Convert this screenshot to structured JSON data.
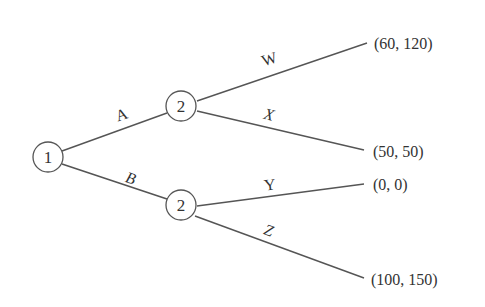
{
  "diagram": {
    "type": "game-tree",
    "nodes": [
      {
        "id": "root",
        "label": "1"
      },
      {
        "id": "p2-top",
        "label": "2"
      },
      {
        "id": "p2-bottom",
        "label": "2"
      }
    ],
    "edges": [
      {
        "from": "root",
        "to": "p2-top",
        "label": "A"
      },
      {
        "from": "root",
        "to": "p2-bottom",
        "label": "B"
      },
      {
        "from": "p2-top",
        "to": "leaf-w",
        "label": "W"
      },
      {
        "from": "p2-top",
        "to": "leaf-x",
        "label": "X"
      },
      {
        "from": "p2-bottom",
        "to": "leaf-y",
        "label": "Y"
      },
      {
        "from": "p2-bottom",
        "to": "leaf-z",
        "label": "Z"
      }
    ],
    "payoffs": [
      {
        "leaf": "leaf-w",
        "label": "(60, 120)"
      },
      {
        "leaf": "leaf-x",
        "label": "(50, 50)"
      },
      {
        "leaf": "leaf-y",
        "label": "(0, 0)"
      },
      {
        "leaf": "leaf-z",
        "label": "(100, 150)"
      }
    ]
  }
}
